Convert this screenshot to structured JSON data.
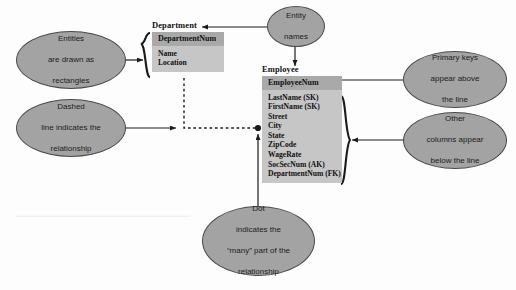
{
  "canvas": {
    "width": 516,
    "height": 290,
    "background": "#fdfdfd",
    "title": "Entity-Relationship Diagram Annotated"
  },
  "colors": {
    "entity_body": "#c6c6c6",
    "entity_key_band": "#a9a9a9",
    "bubble_fill": "#a3a3a3",
    "bubble_stroke": "#4a4a4a",
    "line": "#1a1a1a",
    "text": "#101010"
  },
  "entities": [
    {
      "name": "department",
      "title": "Department",
      "primary_key": "DepartmentNum",
      "columns": [
        "Name",
        "Location"
      ]
    },
    {
      "name": "employee",
      "title": "Employee",
      "primary_key": "EmployeeNum",
      "columns": [
        "LastName (SK)",
        "FirstName (SK)",
        "Street",
        "City",
        "State",
        "ZipCode",
        "WageRate",
        "SocSecNum (AK)",
        "DepartmentNum (FK)"
      ]
    }
  ],
  "callouts": {
    "entities_rectangles": {
      "lines": [
        "Entities",
        "are drawn as",
        "rectangles"
      ]
    },
    "dashed_line": {
      "lines": [
        "Dashed",
        "line indicates the",
        "relationship"
      ]
    },
    "entity_names": {
      "lines": [
        "Entity",
        "names"
      ]
    },
    "primary_keys": {
      "lines": [
        "Primary keys",
        "appear above",
        "the line"
      ]
    },
    "other_columns": {
      "lines": [
        "Other",
        "columns appear",
        "below the line"
      ]
    },
    "dot_many": {
      "lines": [
        "Dot",
        "indicates the",
        "“many” part of the",
        "relationship"
      ]
    }
  },
  "relationship": {
    "type": "one-to-many",
    "from": "Department",
    "to": "Employee",
    "line_style": "dashed",
    "many_marker": "filled-dot"
  }
}
